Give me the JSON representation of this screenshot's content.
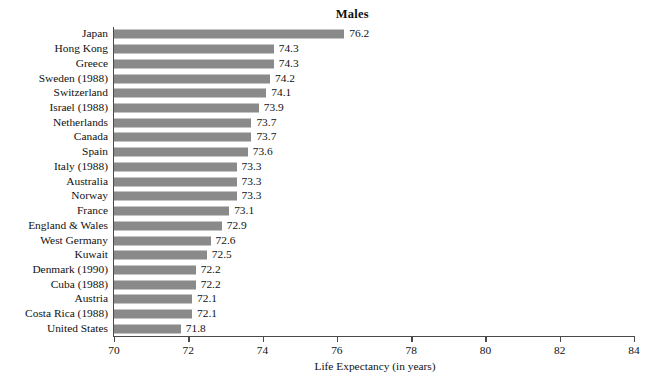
{
  "chart_data": {
    "type": "bar",
    "orientation": "horizontal",
    "title": "Males",
    "xlabel": "Life Expectancy (in years)",
    "ylabel": "",
    "xlim": [
      70,
      84
    ],
    "xticks": [
      70,
      72,
      74,
      76,
      78,
      80,
      82,
      84
    ],
    "grid": false,
    "legend": null,
    "bar_color": "#8a8a8a",
    "axis_color": "#4a4a4a",
    "categories": [
      "Japan",
      "Hong Kong",
      "Greece",
      "Sweden (1988)",
      "Switzerland",
      "Israel (1988)",
      "Netherlands",
      "Canada",
      "Spain",
      "Italy (1988)",
      "Australia",
      "Norway",
      "France",
      "England & Wales",
      "West Germany",
      "Kuwait",
      "Denmark (1990)",
      "Cuba (1988)",
      "Austria",
      "Costa Rica (1988)",
      "United States"
    ],
    "values": [
      76.2,
      74.3,
      74.3,
      74.2,
      74.1,
      73.9,
      73.7,
      73.7,
      73.6,
      73.3,
      73.3,
      73.3,
      73.1,
      72.9,
      72.6,
      72.5,
      72.2,
      72.2,
      72.1,
      72.1,
      71.8
    ],
    "value_labels": [
      "76.2",
      "74.3",
      "74.3",
      "74.2",
      "74.1",
      "73.9",
      "73.7",
      "73.7",
      "73.6",
      "73.3",
      "73.3",
      "73.3",
      "73.1",
      "72.9",
      "72.6",
      "72.5",
      "72.2",
      "72.2",
      "72.1",
      "72.1",
      "71.8"
    ],
    "tick_labels": [
      "70",
      "72",
      "74",
      "76",
      "78",
      "80",
      "82",
      "84"
    ]
  }
}
